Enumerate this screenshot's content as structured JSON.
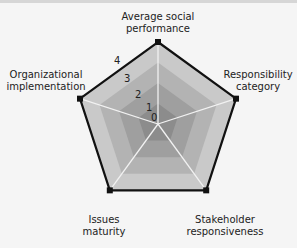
{
  "chart_data": {
    "type": "radar",
    "title": "",
    "axes": [
      "Average social performance",
      "Responsibility category",
      "Stakeholder responsiveness",
      "Issues maturity",
      "Organizational implementation"
    ],
    "series": [
      {
        "name": "score",
        "values": [
          4,
          4,
          4,
          4,
          4
        ]
      }
    ],
    "scale": {
      "min": 0,
      "max": 4,
      "ticks": [
        "0",
        "1",
        "2",
        "3",
        "4"
      ]
    },
    "grid": true,
    "legend": "none"
  },
  "labels": {
    "top_line1": "Average social",
    "top_line2": "performance",
    "right_line1": "Responsibility",
    "right_line2": "category",
    "bottom_right_line1": "Stakeholder",
    "bottom_right_line2": "responsiveness",
    "bottom_left_line1": "Issues",
    "bottom_left_line2": "maturity",
    "left_line1": "Organizational",
    "left_line2": "implementation"
  },
  "colors": {
    "band_4": "#c9c9c9",
    "band_3": "#b3b3b3",
    "band_2": "#9f9f9f",
    "band_1": "#8c8c8c",
    "axis_line": "#f2f2f2",
    "series_line": "#111111"
  }
}
